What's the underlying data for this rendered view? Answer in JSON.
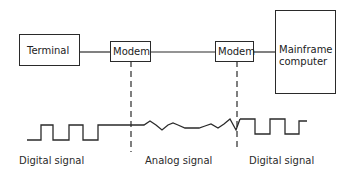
{
  "diagram": {
    "nodes": [
      {
        "id": "terminal",
        "label": "Terminal"
      },
      {
        "id": "modem_left",
        "label": "Modem"
      },
      {
        "id": "modem_right",
        "label": "Modem"
      },
      {
        "id": "mainframe",
        "label_line1": "Mainframe",
        "label_line2": "computer"
      }
    ],
    "edges": [
      {
        "from": "terminal",
        "to": "modem_left"
      },
      {
        "from": "modem_left",
        "to": "modem_right"
      },
      {
        "from": "modem_right",
        "to": "mainframe"
      }
    ],
    "signals": [
      {
        "id": "digital_left",
        "label": "Digital signal",
        "type": "square-wave"
      },
      {
        "id": "analog",
        "label": "Analog signal",
        "type": "analog-wave"
      },
      {
        "id": "digital_right",
        "label": "Digital signal",
        "type": "square-wave"
      }
    ],
    "colors": {
      "stroke": "#2a2a2a",
      "background": "#ffffff"
    }
  }
}
